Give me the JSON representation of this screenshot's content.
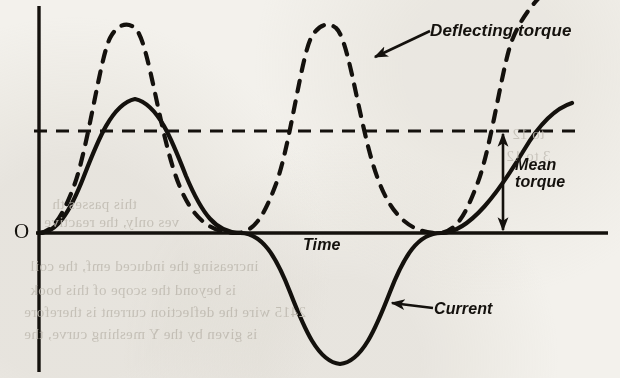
{
  "figure": {
    "background_color": "#f3f1ec",
    "ink_color": "#14110d",
    "origin_label": "O",
    "labels": {
      "deflecting_torque": "Deflecting torque",
      "mean_torque_line1": "Mean",
      "mean_torque_line2": "torque",
      "time": "Time",
      "current": "Current"
    }
  },
  "chart_data": {
    "type": "line",
    "title": "",
    "subtitle": "",
    "xlabel": "Time",
    "ylabel": "",
    "xlim": [
      0,
      2.35
    ],
    "ylim": [
      -1.08,
      1.72
    ],
    "grid": false,
    "legend": "inline-annotations",
    "axes": {
      "x_axis_y_pixel": 233,
      "y_axis_x_pixel": 39,
      "x_axis_from_pixel": 39,
      "x_axis_to_pixel": 608,
      "y_axis_from_pixel": 6,
      "y_axis_to_pixel": 372,
      "tick_labels_x": [],
      "tick_labels_y": []
    },
    "series": [
      {
        "name": "Current",
        "style": "solid",
        "formula": "i = Im * sin(wt)",
        "amplitude": 1.0,
        "period_units": 1.6,
        "phase": 0.0,
        "peak_value": 1.0,
        "trough_value": -1.0,
        "peak_pixel": {
          "x": 135,
          "y": 99
        },
        "trough_pixel": {
          "x": 340,
          "y": 364
        },
        "zero_crossings_pixel": [
          39,
          240,
          441
        ],
        "end_pixel": {
          "x": 572,
          "y": 103
        },
        "annotation": "Current"
      },
      {
        "name": "Deflecting torque",
        "style": "dashed",
        "formula": "T = k * sin^2(wt)",
        "amplitude": 1.7,
        "period_units": 0.8,
        "phase": 0.0,
        "peak_value": 1.7,
        "trough_value": 0.0,
        "peaks_pixel": [
          {
            "x": 135,
            "y": 28
          },
          {
            "x": 336,
            "y": 28
          }
        ],
        "minima_pixel": [
          {
            "x": 39,
            "y": 233
          },
          {
            "x": 236,
            "y": 233
          },
          {
            "x": 438,
            "y": 233
          }
        ],
        "annotation": "Deflecting torque"
      }
    ],
    "reference_lines": [
      {
        "name": "Mean torque",
        "orientation": "horizontal",
        "style": "dashed",
        "value": 0.85,
        "y_pixel": 131,
        "x_from_pixel": 34,
        "x_to_pixel": 581,
        "annotation": "Mean torque"
      }
    ],
    "annotations": [
      {
        "name": "deflecting-torque-pointer",
        "text": "Deflecting torque",
        "arrow_from_pixel": {
          "x": 428,
          "y": 32
        },
        "arrow_to_pixel": {
          "x": 374,
          "y": 57
        }
      },
      {
        "name": "current-pointer",
        "text": "Current",
        "arrow_from_pixel": {
          "x": 432,
          "y": 308
        },
        "arrow_to_pixel": {
          "x": 391,
          "y": 303
        }
      },
      {
        "name": "mean-torque-measure",
        "text": "Mean torque",
        "arrow_type": "double-headed-vertical",
        "x_pixel": 503,
        "y_top_pixel": 133,
        "y_bottom_pixel": 231
      }
    ]
  },
  "bleed_through_text": [
    {
      "text": "this passes th",
      "x": 52,
      "y": 196
    },
    {
      "text": "ves only, the reactive",
      "x": 44,
      "y": 214
    },
    {
      "text": "increasing the induced emf, the coil",
      "x": 30,
      "y": 258
    },
    {
      "text": "is beyond the scope of this book",
      "x": 30,
      "y": 282
    },
    {
      "text": "2415 wire the deflection current is therefore",
      "x": 24,
      "y": 304
    },
    {
      "text": "is given by the Y meshing curve, the",
      "x": 24,
      "y": 326
    },
    {
      "text": "to 12",
      "x": 512,
      "y": 126
    },
    {
      "text": "3 to 12",
      "x": 506,
      "y": 148
    }
  ]
}
